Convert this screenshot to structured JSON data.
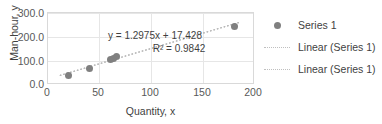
{
  "chart_data": {
    "type": "scatter",
    "title": "",
    "xlabel": "Quantity, x",
    "ylabel": "Man-hour, y",
    "xlim": [
      0,
      200
    ],
    "ylim": [
      0.0,
      300.0
    ],
    "xticks": [
      "0",
      "50",
      "100",
      "150",
      "200"
    ],
    "yticks": [
      "0.0",
      "100.0",
      "200.0",
      "300.0"
    ],
    "grid": true,
    "legend_position": "right",
    "series": [
      {
        "name": "Series 1",
        "marker": "circle",
        "color": "#808080",
        "x": [
          20,
          40,
          60,
          63,
          66,
          180
        ],
        "y": [
          40,
          68,
          105,
          110,
          118,
          245
        ]
      }
    ],
    "trendlines": [
      {
        "name": "Linear (Series 1)",
        "style": "dotted",
        "color": "#a6a6a6",
        "equation": "y = 1.2975x + 17.428",
        "r_squared": "R² = 0.9842",
        "slope": 1.2975,
        "intercept": 17.428
      },
      {
        "name": "Linear (Series 1)",
        "style": "dotted",
        "color": "#bfbfbf",
        "equation": "y = 1.2975x + 17.428",
        "r_squared": "R² = 0.9842",
        "slope": 1.2975,
        "intercept": 17.428
      }
    ],
    "annotation": {
      "equation": "y = 1.2975x + 17.428",
      "r_squared": "R² = 0.9842"
    },
    "legend": [
      {
        "label": "Series 1",
        "key": "marker-dot"
      },
      {
        "label": "Linear (Series 1)",
        "key": "dotted-line"
      },
      {
        "label": "Linear (Series 1)",
        "key": "dotted-line"
      }
    ]
  }
}
